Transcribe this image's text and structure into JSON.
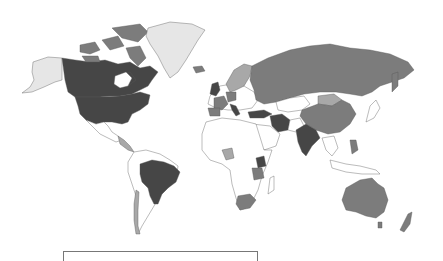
{
  "map": {
    "type": "choropleth",
    "projection": "mercator-like world",
    "palette": {
      "ocean": "#ffffff",
      "none": "#ffffff",
      "light": "#e6e6e6",
      "mid_light": "#a8a8a8",
      "mid": "#7c7c7c",
      "dark": "#464646",
      "border": "#555555"
    },
    "regions": [
      {
        "name": "Canada",
        "class": "dark"
      },
      {
        "name": "United States",
        "class": "dark"
      },
      {
        "name": "Alaska",
        "class": "light"
      },
      {
        "name": "Greenland",
        "class": "light"
      },
      {
        "name": "Canadian Arctic Islands",
        "class": "mid"
      },
      {
        "name": "Mexico",
        "class": "none"
      },
      {
        "name": "Central America",
        "class": "mid_light"
      },
      {
        "name": "Brazil",
        "class": "dark"
      },
      {
        "name": "Chile",
        "class": "mid_light"
      },
      {
        "name": "South America (other)",
        "class": "none"
      },
      {
        "name": "Russia",
        "class": "mid"
      },
      {
        "name": "China",
        "class": "mid"
      },
      {
        "name": "Mongolia",
        "class": "mid_light"
      },
      {
        "name": "India",
        "class": "dark"
      },
      {
        "name": "Iran",
        "class": "dark"
      },
      {
        "name": "Turkey",
        "class": "dark"
      },
      {
        "name": "Pakistan",
        "class": "none"
      },
      {
        "name": "Kazakhstan",
        "class": "none"
      },
      {
        "name": "Australia",
        "class": "mid"
      },
      {
        "name": "New Zealand",
        "class": "mid"
      },
      {
        "name": "Japan",
        "class": "none"
      },
      {
        "name": "Philippines",
        "class": "mid"
      },
      {
        "name": "Indonesia",
        "class": "none"
      },
      {
        "name": "Scandinavia",
        "class": "mid_light"
      },
      {
        "name": "United Kingdom",
        "class": "dark"
      },
      {
        "name": "France",
        "class": "mid"
      },
      {
        "name": "Spain",
        "class": "mid"
      },
      {
        "name": "Italy",
        "class": "dark"
      },
      {
        "name": "Germany",
        "class": "mid"
      },
      {
        "name": "Nigeria",
        "class": "mid_light"
      },
      {
        "name": "Kenya",
        "class": "dark"
      },
      {
        "name": "Tanzania",
        "class": "mid"
      },
      {
        "name": "South Africa",
        "class": "mid"
      },
      {
        "name": "Africa (other)",
        "class": "none"
      },
      {
        "name": "Iceland",
        "class": "mid"
      }
    ]
  },
  "legend": {
    "visible_text": ""
  }
}
